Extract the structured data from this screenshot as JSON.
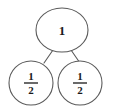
{
  "diagram": {
    "type": "fraction-tree",
    "background_color": "#ffffff",
    "stroke_color": "#5a5a5a",
    "text_color": "#1a1a1a",
    "root": {
      "label": "1",
      "shape": "ellipse",
      "cx": 62,
      "cy": 30,
      "rx": 26,
      "ry": 22
    },
    "children": [
      {
        "shape": "circle",
        "numerator": "1",
        "denominator": "2",
        "fraction_text": "1/2",
        "cx": 31,
        "cy": 83,
        "r": 22
      },
      {
        "shape": "circle",
        "numerator": "1",
        "denominator": "2",
        "fraction_text": "1/2",
        "cx": 80,
        "cy": 83,
        "r": 22
      }
    ],
    "connectors": [
      {
        "x1": 53,
        "y1": 50,
        "x2": 44,
        "y2": 63
      },
      {
        "x1": 71,
        "y1": 50,
        "x2": 80,
        "y2": 63
      }
    ]
  }
}
